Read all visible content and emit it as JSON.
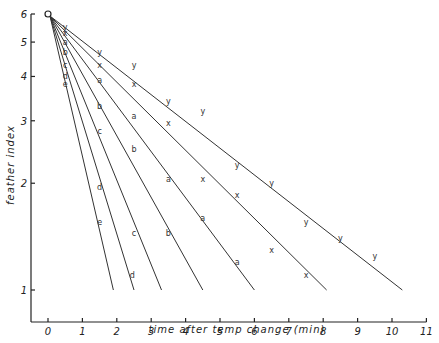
{
  "chart_data": {
    "type": "line",
    "title": "",
    "xlabel": "time after temp change (min)",
    "ylabel": "feather index",
    "xlim": [
      -0.5,
      11
    ],
    "ylim": [
      0.9,
      6
    ],
    "yscale": "log",
    "x_ticks": [
      0,
      1,
      2,
      3,
      4,
      5,
      6,
      7,
      8,
      9,
      10,
      11
    ],
    "y_ticks": [
      1,
      2,
      3,
      4,
      5,
      6
    ],
    "grid": false,
    "legend": null,
    "origin_marker": {
      "x": 0,
      "y": 6,
      "symbol": "o"
    },
    "series": [
      {
        "name": "e",
        "line": [
          [
            0,
            6
          ],
          [
            1.9,
            1
          ]
        ],
        "points": [
          [
            0.5,
            3.8
          ],
          [
            1.5,
            1.55
          ]
        ]
      },
      {
        "name": "d",
        "line": [
          [
            0,
            6
          ],
          [
            2.5,
            1
          ]
        ],
        "points": [
          [
            0.5,
            4.0
          ],
          [
            1.5,
            1.95
          ],
          [
            2.45,
            1.1
          ]
        ]
      },
      {
        "name": "c",
        "line": [
          [
            0,
            6
          ],
          [
            3.3,
            1
          ]
        ],
        "points": [
          [
            0.5,
            4.3
          ],
          [
            1.5,
            2.8
          ],
          [
            2.5,
            1.45
          ]
        ]
      },
      {
        "name": "b",
        "line": [
          [
            0,
            6
          ],
          [
            4.5,
            1
          ]
        ],
        "points": [
          [
            0.5,
            4.7
          ],
          [
            1.5,
            3.3
          ],
          [
            2.5,
            2.5
          ],
          [
            3.5,
            1.45
          ]
        ]
      },
      {
        "name": "a",
        "line": [
          [
            0,
            6
          ],
          [
            6.0,
            1
          ]
        ],
        "points": [
          [
            0.5,
            5.0
          ],
          [
            1.5,
            3.9
          ],
          [
            2.5,
            3.1
          ],
          [
            3.5,
            2.05
          ],
          [
            4.5,
            1.6
          ],
          [
            5.5,
            1.2
          ]
        ]
      },
      {
        "name": "x",
        "line": [
          [
            0,
            6
          ],
          [
            8.1,
            1
          ]
        ],
        "points": [
          [
            0.5,
            5.3
          ],
          [
            1.5,
            4.3
          ],
          [
            2.5,
            3.8
          ],
          [
            3.5,
            2.95
          ],
          [
            4.5,
            2.05
          ],
          [
            5.5,
            1.85
          ],
          [
            6.5,
            1.3
          ],
          [
            7.5,
            1.1
          ]
        ]
      },
      {
        "name": "y",
        "line": [
          [
            0,
            6
          ],
          [
            10.3,
            1
          ]
        ],
        "points": [
          [
            0.5,
            5.5
          ],
          [
            1.5,
            4.7
          ],
          [
            2.5,
            4.3
          ],
          [
            3.5,
            3.4
          ],
          [
            4.5,
            3.2
          ],
          [
            5.5,
            2.25
          ],
          [
            6.5,
            2.0
          ],
          [
            7.5,
            1.55
          ],
          [
            8.5,
            1.4
          ],
          [
            9.5,
            1.25
          ]
        ]
      }
    ]
  },
  "axes": {
    "x_label": "time after temp change (min)",
    "y_label": "feather index",
    "x_tick_labels": [
      "0",
      "1",
      "2",
      "3",
      "4",
      "5",
      "6",
      "7",
      "8",
      "9",
      "10",
      "11"
    ],
    "y_tick_labels": [
      "1",
      "2",
      "3",
      "4",
      "5",
      "6"
    ]
  }
}
